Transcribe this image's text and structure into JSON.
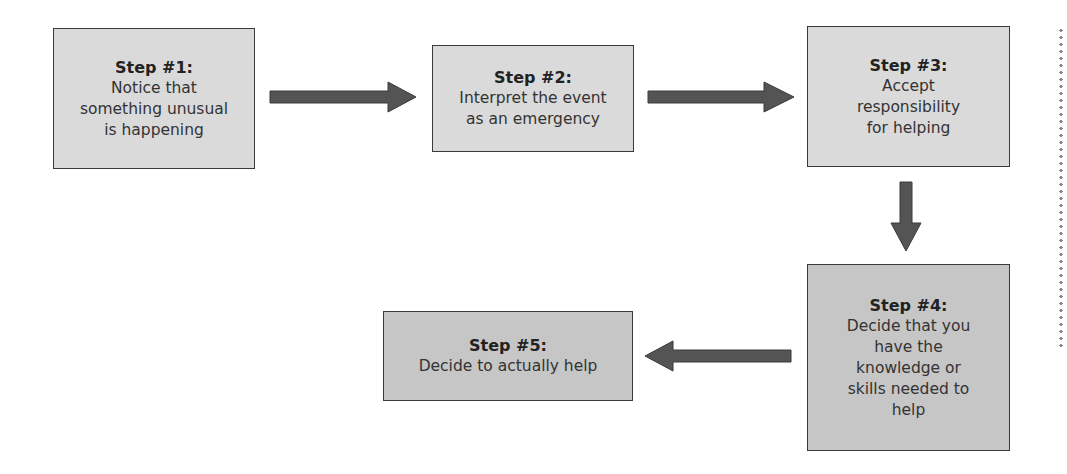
{
  "diagram": {
    "type": "flowchart",
    "steps": [
      {
        "title": "Step #1:",
        "text": "Notice that\nsomething unusual\nis happening"
      },
      {
        "title": "Step #2:",
        "text": "Interpret the event\nas an emergency"
      },
      {
        "title": "Step #3:",
        "text": "Accept\nresponsibility\nfor helping"
      },
      {
        "title": "Step #4:",
        "text": "Decide that you\nhave the\nknowledge or\nskills needed to\nhelp"
      },
      {
        "title": "Step #5:",
        "text": "Decide to actually help"
      }
    ],
    "connections": [
      {
        "from": "Step #1",
        "to": "Step #2",
        "direction": "right"
      },
      {
        "from": "Step #2",
        "to": "Step #3",
        "direction": "right"
      },
      {
        "from": "Step #3",
        "to": "Step #4",
        "direction": "down"
      },
      {
        "from": "Step #4",
        "to": "Step #5",
        "direction": "left"
      }
    ],
    "colors": {
      "box_light": "#dadada",
      "box_dark": "#c6c6c6",
      "border": "#3a3a3a",
      "arrow": "#545454"
    }
  }
}
